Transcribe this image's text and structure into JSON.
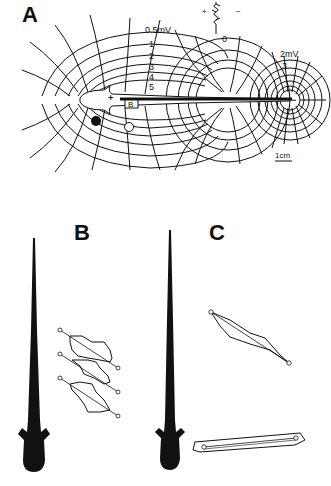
{
  "figure": {
    "panels": [
      {
        "id": "A",
        "label": "A",
        "description": "Electric field isopotential map around electric fish",
        "isopotential_labels_head": [
          "0.5mV",
          "1",
          "2",
          "3",
          "4",
          "5"
        ],
        "isopotential_labels_tail": [
          "2mV",
          "3"
        ],
        "zero_label": "0",
        "polarity_head": "+",
        "polarity_tail": "−",
        "waveform_plus": "+",
        "waveform_minus": "−",
        "box_label": "B",
        "scale_bar": "1cm"
      },
      {
        "id": "B",
        "label": "B",
        "description": "Three electrode-pair loop traces beside fish silhouette"
      },
      {
        "id": "C",
        "label": "C",
        "description": "Two electrode-pair loop traces beside fish silhouette"
      }
    ],
    "colors": {
      "ink": "#111111",
      "background": "#ffffff"
    }
  }
}
